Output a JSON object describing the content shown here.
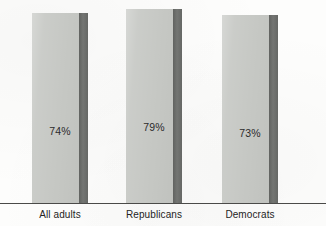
{
  "chart_data": {
    "type": "bar",
    "title": "",
    "subtitle": "",
    "xlabel": "",
    "ylabel": "",
    "ylim": [
      0,
      100
    ],
    "grid": false,
    "legend": null,
    "orientation": "vertical",
    "categories": [
      "All adults",
      "Republicans",
      "Democrats"
    ],
    "values": [
      74,
      79,
      73
    ],
    "value_labels": [
      "74%",
      "79%",
      "73%"
    ],
    "series": [
      {
        "name": "",
        "values": [
          74,
          79,
          73
        ]
      }
    ],
    "colors": {
      "bar_fill": "#c5c7c3",
      "bar_edge": "#6c6e6b",
      "axis_line": "#4a4a48",
      "label_text": "#242424",
      "value_text": "#2b2b2b",
      "background": "#fdfdfc"
    }
  },
  "bars": [
    {
      "category": "All adults",
      "value_label": "74%",
      "left_px": 32,
      "width_px": 56,
      "edge_width_px": 9,
      "top_px": 13
    },
    {
      "category": "Republicans",
      "value_label": "79%",
      "left_px": 126,
      "width_px": 56,
      "edge_width_px": 9,
      "top_px": 9
    },
    {
      "category": "Democrats",
      "value_label": "73%",
      "left_px": 222,
      "width_px": 56,
      "edge_width_px": 9,
      "top_px": 15
    }
  ],
  "axis": {
    "baseline_visible": true
  }
}
